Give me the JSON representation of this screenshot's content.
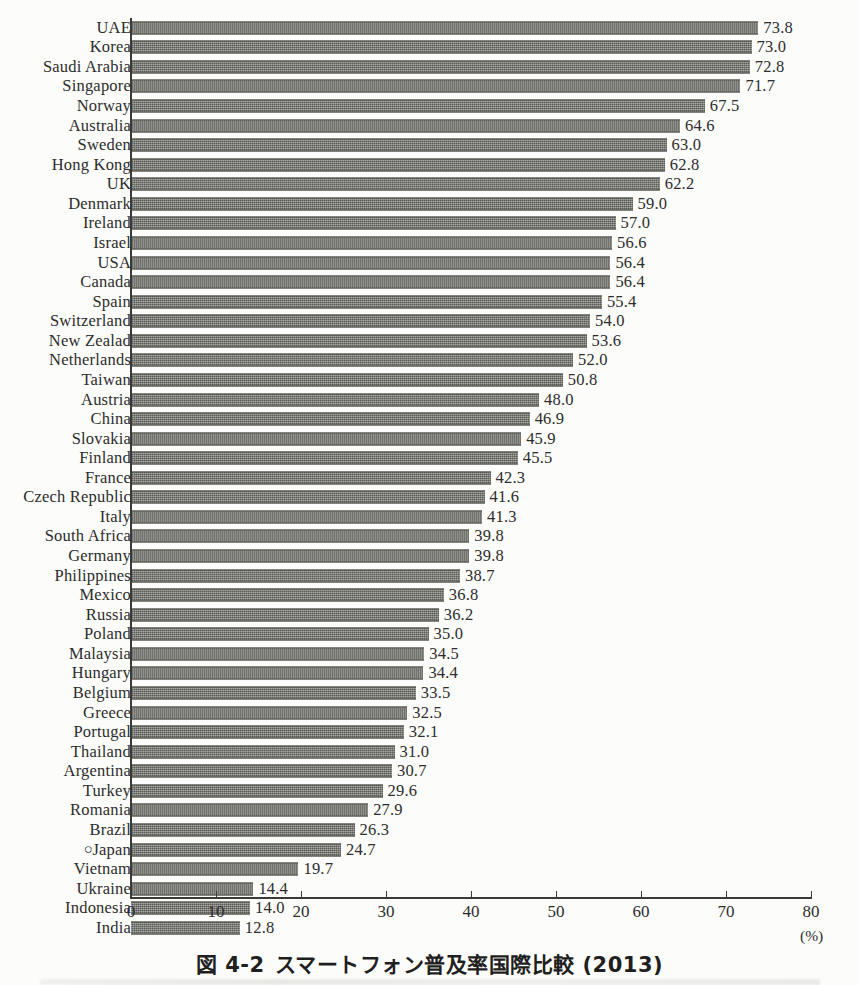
{
  "caption": {
    "figure_number": "図 4-2",
    "title": "スマートフォン普及率国際比較 (2013)"
  },
  "axis": {
    "unit_label": "(%)",
    "ticks": [
      0,
      10,
      20,
      30,
      40,
      50,
      60,
      70,
      80
    ]
  },
  "japan_marker": "○",
  "chart_data": {
    "type": "bar",
    "orientation": "horizontal",
    "xlabel": "(%)",
    "ylabel": "",
    "xlim": [
      0,
      80
    ],
    "grid": false,
    "legend": false,
    "categories": [
      "UAE",
      "Korea",
      "Saudi Arabia",
      "Singapore",
      "Norway",
      "Australia",
      "Sweden",
      "Hong Kong",
      "UK",
      "Denmark",
      "Ireland",
      "Israel",
      "USA",
      "Canada",
      "Spain",
      "Switzerland",
      "New Zealad",
      "Netherlands",
      "Taiwan",
      "Austria",
      "China",
      "Slovakia",
      "Finland",
      "France",
      "Czech Republic",
      "Italy",
      "South Africa",
      "Germany",
      "Philippines",
      "Mexico",
      "Russia",
      "Poland",
      "Malaysia",
      "Hungary",
      "Belgium",
      "Greece",
      "Portugal",
      "Thailand",
      "Argentina",
      "Turkey",
      "Romania",
      "Brazil",
      "Japan",
      "Vietnam",
      "Ukraine",
      "Indonesia",
      "India"
    ],
    "values": [
      73.8,
      73.0,
      72.8,
      71.7,
      67.5,
      64.6,
      63.0,
      62.8,
      62.2,
      59.0,
      57.0,
      56.6,
      56.4,
      56.4,
      55.4,
      54.0,
      53.6,
      52.0,
      50.8,
      48.0,
      46.9,
      45.9,
      45.5,
      42.3,
      41.6,
      41.3,
      39.8,
      39.8,
      38.7,
      36.8,
      36.2,
      35.0,
      34.5,
      34.4,
      33.5,
      32.5,
      32.1,
      31.0,
      30.7,
      29.6,
      27.9,
      26.3,
      24.7,
      19.7,
      14.4,
      14.0,
      12.8
    ],
    "value_labels": [
      "73.8",
      "73.0",
      "72.8",
      "71.7",
      "67.5",
      "64.6",
      "63.0",
      "62.8",
      "62.2",
      "59.0",
      "57.0",
      "56.6",
      "56.4",
      "56.4",
      "55.4",
      "54.0",
      "53.6",
      "52.0",
      "50.8",
      "48.0",
      "46.9",
      "45.9",
      "45.5",
      "42.3",
      "41.6",
      "41.3",
      "39.8",
      "39.8",
      "38.7",
      "36.8",
      "36.2",
      "35.0",
      "34.5",
      "34.4",
      "33.5",
      "32.5",
      "32.1",
      "31.0",
      "30.7",
      "29.6",
      "27.9",
      "26.3",
      "24.7",
      "19.7",
      "14.4",
      "14.0",
      "12.8"
    ],
    "highlighted_category": "Japan",
    "bar_color": "#6e6e68"
  }
}
